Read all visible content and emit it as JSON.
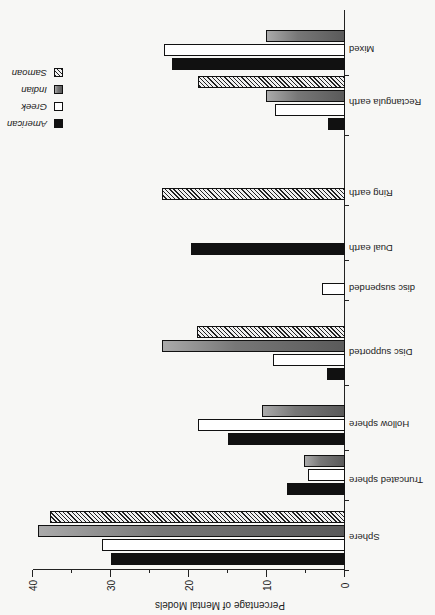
{
  "chart_data": {
    "type": "bar",
    "orientation": "horizontal",
    "rotation": "image rotated 180 degrees",
    "title": "",
    "xlabel": "Percentage of Mental Models",
    "ylabel": "",
    "xlim": [
      0,
      40
    ],
    "xticks": [
      "0",
      "10",
      "20",
      "30",
      "40"
    ],
    "grid": false,
    "legend_position": "top-right (upper-left of rotated image)",
    "categories": [
      "Sphere",
      "Truncated sphere",
      "Hollow sphere",
      "Disc supported",
      "disc suspended",
      "Dual earth",
      "Ring earth",
      "Rectangula earth",
      "Mixed"
    ],
    "series": [
      {
        "name": "American",
        "values": [
          30,
          7.4,
          15,
          2.3,
          0,
          19.8,
          0,
          2.2,
          22.2
        ]
      },
      {
        "name": "Greek",
        "values": [
          31.2,
          4.8,
          18.9,
          9.2,
          2.9,
          0,
          0,
          9,
          23.2
        ]
      },
      {
        "name": "Indian",
        "values": [
          39.3,
          5.3,
          10.6,
          23.5,
          0,
          0,
          0,
          10.1,
          10.1
        ]
      },
      {
        "name": "Samoan",
        "values": [
          37.8,
          0,
          0,
          19,
          0,
          0,
          23.5,
          18.8,
          0
        ]
      }
    ]
  },
  "legend": [
    {
      "label": "American",
      "style": "solid black"
    },
    {
      "label": "Greek",
      "style": "white"
    },
    {
      "label": "Indian",
      "style": "gray stipple"
    },
    {
      "label": "Samoan",
      "style": "diagonal hatch"
    }
  ]
}
